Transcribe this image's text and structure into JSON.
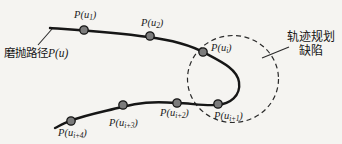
{
  "figure": {
    "type": "curve-diagram",
    "description_visible_text_only": true,
    "colors": {
      "background": "#f5f4f1",
      "ink": "#1c1c1c",
      "dot_fill": "#7b7b7b",
      "dot_stroke": "#151515"
    },
    "path_callout": {
      "zh": "磨抛路径",
      "math_base": "P(u",
      "math_close": ")"
    },
    "defect_callout": {
      "line1": "轨迹规划",
      "line2": "缺陷"
    },
    "points": [
      {
        "base": "P(u",
        "sub": "1",
        "close": ")"
      },
      {
        "base": "P(u",
        "sub": "2",
        "close": ")"
      },
      {
        "base": "P(u",
        "sub": "i",
        "close": ")"
      },
      {
        "base": "P(u",
        "sub": "i+1",
        "close": ")"
      },
      {
        "base": "P(u",
        "sub": "i+2",
        "close": ")"
      },
      {
        "base": "P(u",
        "sub": "i+3",
        "close": ")"
      },
      {
        "base": "P(u",
        "sub": "i+4",
        "close": ")"
      }
    ]
  }
}
